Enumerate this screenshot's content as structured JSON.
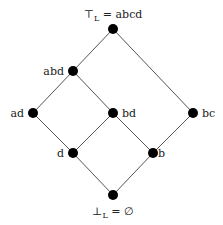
{
  "diagram": {
    "type": "lattice",
    "nodes": [
      {
        "id": "top",
        "label": "⊤_L = abcd",
        "label_main": "⊤",
        "label_sub": "L",
        "label_rest": " = abcd",
        "x": 113,
        "y": 29
      },
      {
        "id": "abd",
        "label": "abd",
        "x": 73,
        "y": 71
      },
      {
        "id": "ad",
        "label": "ad",
        "x": 33,
        "y": 113
      },
      {
        "id": "bd",
        "label": "bd",
        "x": 113,
        "y": 113
      },
      {
        "id": "bc",
        "label": "bc",
        "x": 193,
        "y": 113
      },
      {
        "id": "d",
        "label": "d",
        "x": 73,
        "y": 153
      },
      {
        "id": "b",
        "label": "b",
        "x": 153,
        "y": 153
      },
      {
        "id": "bottom",
        "label": "⊥_L = ∅",
        "label_main": "⊥",
        "label_sub": "L",
        "label_rest": " = ∅",
        "x": 113,
        "y": 195
      }
    ],
    "edges": [
      [
        "top",
        "abd"
      ],
      [
        "top",
        "bc"
      ],
      [
        "abd",
        "ad"
      ],
      [
        "abd",
        "bd"
      ],
      [
        "ad",
        "d"
      ],
      [
        "bd",
        "d"
      ],
      [
        "bd",
        "b"
      ],
      [
        "bc",
        "b"
      ],
      [
        "d",
        "bottom"
      ],
      [
        "b",
        "bottom"
      ]
    ]
  }
}
